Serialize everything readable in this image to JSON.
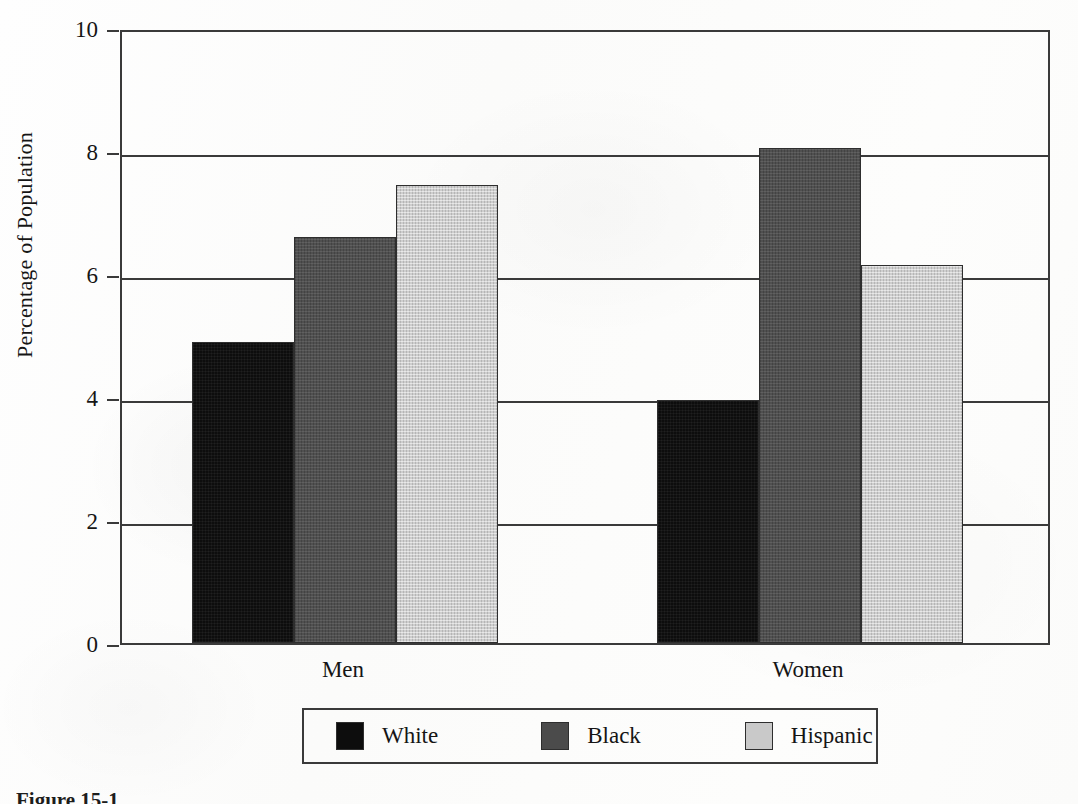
{
  "chart_data": {
    "type": "bar",
    "title": "",
    "subtitle": "",
    "xlabel": "",
    "ylabel": "Percentage of Population",
    "categories": [
      "Men",
      "Women"
    ],
    "series": [
      {
        "name": "White",
        "color": "#0d0d0d",
        "values": [
          4.9,
          3.95
        ]
      },
      {
        "name": "Black",
        "color": "#4b4b4b",
        "values": [
          6.6,
          8.05
        ]
      },
      {
        "name": "Hispanic",
        "color": "#c9c9c9",
        "values": [
          7.45,
          6.15
        ]
      }
    ],
    "ylim": [
      0,
      10
    ],
    "yticks": [
      0,
      2,
      4,
      6,
      8,
      10
    ],
    "ytick_labels": [
      "0",
      "2",
      "4",
      "6",
      "8",
      "10"
    ],
    "grid": true,
    "grid_axis": "y",
    "legend_position": "below-axis-boxed"
  },
  "axes": {
    "y_ticks": [
      {
        "label": "10",
        "value": 10
      },
      {
        "label": "8",
        "value": 8
      },
      {
        "label": "6",
        "value": 6
      },
      {
        "label": "4",
        "value": 4
      },
      {
        "label": "2",
        "value": 2
      },
      {
        "label": "0",
        "value": 0
      }
    ],
    "y_axis_title": "Percentage of Population",
    "x_ticks": [
      {
        "label": "Men"
      },
      {
        "label": "Women"
      }
    ]
  },
  "legend": {
    "entries": [
      {
        "label": "White",
        "color": "#0d0d0d"
      },
      {
        "label": "Black",
        "color": "#4b4b4b"
      },
      {
        "label": "Hispanic",
        "color": "#c9c9c9"
      }
    ]
  },
  "caption": {
    "text": "Figure 15-1"
  }
}
